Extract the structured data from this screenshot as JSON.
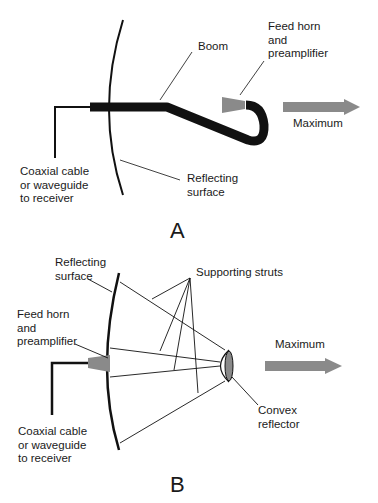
{
  "diagram_a": {
    "letter": "A",
    "labels": {
      "boom": "Boom",
      "feed_horn": "Feed horn\nand\npreamplifier",
      "maximum": "Maximum",
      "coax": "Coaxial cable\nor waveguide\nto receiver",
      "reflecting": "Reflecting\nsurface"
    }
  },
  "diagram_b": {
    "letter": "B",
    "labels": {
      "reflecting": "Reflecting\nsurface",
      "struts": "Supporting struts",
      "feed_horn": "Feed horn\nand\npreamplifier",
      "maximum": "Maximum",
      "convex": "Convex\nreflector",
      "coax": "Coaxial cable\nor waveguide\nto receiver"
    }
  },
  "colors": {
    "line": "#111111",
    "gray": "#8a8a8a"
  }
}
